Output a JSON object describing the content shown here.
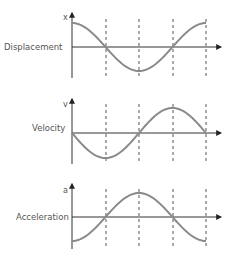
{
  "diagram": {
    "colors": {
      "curve": "#8a8a8a",
      "axis": "#333333",
      "dash": "#444444",
      "label": "#555555"
    },
    "x_axis": {
      "origin_x": 72,
      "end_x": 222,
      "dashed_x": [
        106,
        139,
        173,
        206
      ]
    },
    "panels": [
      {
        "name": "Displacement",
        "axis_symbol": "x",
        "axis_y": 47,
        "amp": 24,
        "arrow_top": 12,
        "bottom": 78,
        "function": "cos",
        "phase": "starts at max"
      },
      {
        "name": "Velocity",
        "axis_symbol": "v",
        "axis_y": 133,
        "amp": 25,
        "arrow_top": 98,
        "bottom": 164,
        "function": "-sin",
        "phase": "starts at zero going negative"
      },
      {
        "name": "Acceleration",
        "axis_symbol": "a",
        "axis_y": 217,
        "amp": 24,
        "arrow_top": 183,
        "bottom": 249,
        "function": "-cos",
        "phase": "starts at min"
      }
    ]
  }
}
